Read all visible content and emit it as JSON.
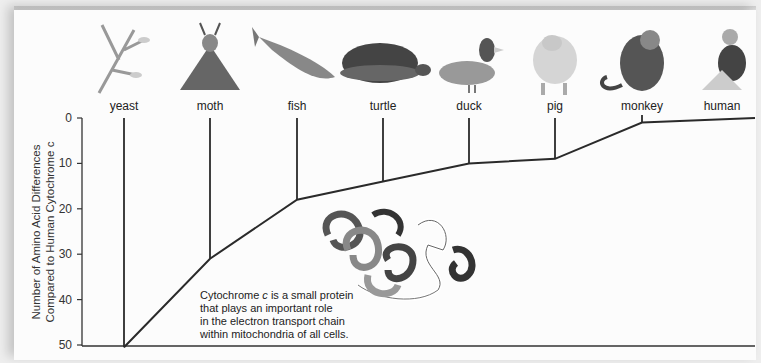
{
  "chart_data": {
    "type": "line",
    "subtype": "phylogenetic-tree",
    "title": "",
    "ylabel_line1": "Number of Amino Acid Differences",
    "ylabel_line2": "Compared to Human Cytochrome c",
    "xlabel": "",
    "ylim": [
      0,
      50
    ],
    "y_inverted": true,
    "y_ticks": [
      0,
      10,
      20,
      30,
      40,
      50
    ],
    "categories": [
      "yeast",
      "moth",
      "fish",
      "turtle",
      "duck",
      "pig",
      "monkey",
      "human"
    ],
    "values": [
      51,
      31,
      18,
      14,
      10,
      9,
      1,
      0
    ],
    "grid": false,
    "legend": null,
    "annotation": {
      "line1_pre": "Cytochrome ",
      "line1_italic": "c",
      "line1_post": " is a small protein",
      "line2": "that plays an important role",
      "line3": "in the electron transport chain",
      "line4": "within mitochondria of all cells."
    }
  },
  "organisms": [
    {
      "label": "yeast",
      "icon": "yeast-icon"
    },
    {
      "label": "moth",
      "icon": "moth-icon"
    },
    {
      "label": "fish",
      "icon": "fish-icon"
    },
    {
      "label": "turtle",
      "icon": "turtle-icon"
    },
    {
      "label": "duck",
      "icon": "duck-icon"
    },
    {
      "label": "pig",
      "icon": "pig-icon"
    },
    {
      "label": "monkey",
      "icon": "monkey-icon"
    },
    {
      "label": "human",
      "icon": "human-icon"
    }
  ],
  "colors": {
    "line": "#2a2a2a",
    "background": "#fcfcfc"
  }
}
